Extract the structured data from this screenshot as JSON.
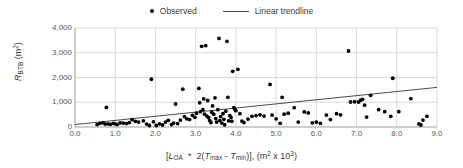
{
  "legend": {
    "position": "top-center",
    "entries": [
      {
        "label": "Observed",
        "marker": "dot",
        "color": "#000000"
      },
      {
        "label": "Linear trendline",
        "marker": "line",
        "color": "#4a4a4a"
      }
    ]
  },
  "axis_titles": {
    "y_main": "R",
    "y_sub": "BTB",
    "y_units": " (m",
    "y_units_sup": "2",
    "y_units_close": ")",
    "x_full": "[LOA * 2(Tmax - Tmin)], (m2 x 103)"
  },
  "chart_data": {
    "type": "scatter",
    "title": "",
    "xlabel": "[L_OA * 2(T_max - T_min)], (m^2 x 10^3)",
    "ylabel": "R_BTB (m^2)",
    "xlim": [
      0.0,
      9.0
    ],
    "ylim": [
      0,
      4000
    ],
    "xticks": [
      "0.0",
      "1.0",
      "2.0",
      "3.0",
      "4.0",
      "5.0",
      "6.0",
      "7.0",
      "8.0",
      "9.0"
    ],
    "yticks": [
      "0",
      "1,000",
      "2,000",
      "3,000",
      "4,000"
    ],
    "xtick_values": [
      0,
      1,
      2,
      3,
      4,
      5,
      6,
      7,
      8,
      9
    ],
    "ytick_values": [
      0,
      1000,
      2000,
      3000,
      4000
    ],
    "grid": true,
    "grid_color": "#d9d9d9",
    "legend_position": "top-center",
    "series": [
      {
        "name": "Observed",
        "type": "scatter",
        "marker": "filled-circle",
        "color": "#000000",
        "points": [
          [
            0.55,
            100
          ],
          [
            0.62,
            150
          ],
          [
            0.7,
            170
          ],
          [
            0.75,
            120
          ],
          [
            0.78,
            790
          ],
          [
            0.82,
            130
          ],
          [
            0.88,
            110
          ],
          [
            0.95,
            150
          ],
          [
            1.0,
            130
          ],
          [
            1.05,
            100
          ],
          [
            1.12,
            170
          ],
          [
            1.2,
            160
          ],
          [
            1.28,
            140
          ],
          [
            1.35,
            180
          ],
          [
            1.42,
            300
          ],
          [
            1.5,
            230
          ],
          [
            1.58,
            200
          ],
          [
            1.7,
            250
          ],
          [
            1.78,
            120
          ],
          [
            1.85,
            60
          ],
          [
            1.9,
            1930
          ],
          [
            1.95,
            210
          ],
          [
            2.02,
            60
          ],
          [
            2.1,
            130
          ],
          [
            2.18,
            80
          ],
          [
            2.25,
            200
          ],
          [
            2.32,
            270
          ],
          [
            2.4,
            100
          ],
          [
            2.45,
            160
          ],
          [
            2.5,
            930
          ],
          [
            2.55,
            140
          ],
          [
            2.62,
            280
          ],
          [
            2.68,
            1530
          ],
          [
            2.72,
            420
          ],
          [
            2.78,
            330
          ],
          [
            2.85,
            300
          ],
          [
            2.92,
            470
          ],
          [
            2.98,
            390
          ],
          [
            3.02,
            560
          ],
          [
            3.08,
            1560
          ],
          [
            3.1,
            980
          ],
          [
            3.12,
            620
          ],
          [
            3.15,
            3260
          ],
          [
            3.18,
            700
          ],
          [
            3.2,
            1140
          ],
          [
            3.22,
            520
          ],
          [
            3.25,
            3290
          ],
          [
            3.28,
            440
          ],
          [
            3.3,
            1070
          ],
          [
            3.32,
            380
          ],
          [
            3.35,
            260
          ],
          [
            3.38,
            180
          ],
          [
            3.4,
            600
          ],
          [
            3.42,
            850
          ],
          [
            3.45,
            520
          ],
          [
            3.48,
            1180
          ],
          [
            3.5,
            340
          ],
          [
            3.52,
            200
          ],
          [
            3.55,
            700
          ],
          [
            3.58,
            3580
          ],
          [
            3.6,
            260
          ],
          [
            3.62,
            420
          ],
          [
            3.65,
            160
          ],
          [
            3.68,
            540
          ],
          [
            3.7,
            310
          ],
          [
            3.72,
            90
          ],
          [
            3.75,
            640
          ],
          [
            3.78,
            3460
          ],
          [
            3.8,
            1200
          ],
          [
            3.82,
            250
          ],
          [
            3.85,
            460
          ],
          [
            3.88,
            380
          ],
          [
            3.9,
            230
          ],
          [
            3.92,
            2250
          ],
          [
            3.95,
            780
          ],
          [
            3.98,
            700
          ],
          [
            4.0,
            660
          ],
          [
            4.05,
            2330
          ],
          [
            4.1,
            540
          ],
          [
            4.15,
            240
          ],
          [
            4.2,
            180
          ],
          [
            4.3,
            320
          ],
          [
            4.4,
            430
          ],
          [
            4.5,
            460
          ],
          [
            4.6,
            490
          ],
          [
            4.7,
            440
          ],
          [
            4.85,
            1720
          ],
          [
            4.9,
            480
          ],
          [
            5.0,
            330
          ],
          [
            5.1,
            150
          ],
          [
            5.15,
            1200
          ],
          [
            5.2,
            520
          ],
          [
            5.3,
            560
          ],
          [
            5.45,
            780
          ],
          [
            5.55,
            200
          ],
          [
            5.7,
            610
          ],
          [
            5.8,
            570
          ],
          [
            5.9,
            170
          ],
          [
            6.0,
            200
          ],
          [
            6.1,
            150
          ],
          [
            6.25,
            480
          ],
          [
            6.35,
            300
          ],
          [
            6.5,
            540
          ],
          [
            6.6,
            490
          ],
          [
            6.8,
            3070
          ],
          [
            6.85,
            1010
          ],
          [
            6.95,
            1020
          ],
          [
            7.05,
            1010
          ],
          [
            7.1,
            1080
          ],
          [
            7.15,
            1120
          ],
          [
            7.2,
            880
          ],
          [
            7.25,
            400
          ],
          [
            7.35,
            1280
          ],
          [
            7.55,
            700
          ],
          [
            7.7,
            620
          ],
          [
            7.85,
            430
          ],
          [
            7.9,
            1970
          ],
          [
            8.05,
            620
          ],
          [
            8.35,
            1150
          ],
          [
            8.55,
            130
          ],
          [
            8.6,
            80
          ],
          [
            8.65,
            280
          ],
          [
            8.75,
            430
          ]
        ]
      },
      {
        "name": "Linear trendline",
        "type": "line",
        "color": "#4a4a4a",
        "endpoints": [
          [
            0.0,
            100
          ],
          [
            9.0,
            1600
          ]
        ],
        "slope": 166.7,
        "intercept": 100
      }
    ]
  }
}
